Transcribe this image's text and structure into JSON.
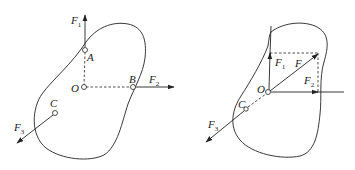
{
  "diagram": {
    "colors": {
      "stroke": "#222222",
      "background": "#ffffff"
    },
    "left": {
      "points": {
        "O": {
          "label": "O",
          "x": 83,
          "y": 87
        },
        "A": {
          "label": "A",
          "x": 85,
          "y": 50
        },
        "B": {
          "label": "B",
          "x": 133,
          "y": 87
        },
        "C": {
          "label": "C",
          "x": 55,
          "y": 113
        }
      },
      "forces": [
        {
          "label": "F",
          "sub": "1",
          "from": "A",
          "direction": "up"
        },
        {
          "label": "F",
          "sub": "2",
          "from": "B",
          "direction": "right"
        },
        {
          "label": "F",
          "sub": "3",
          "from": "C",
          "direction": "down-left"
        }
      ],
      "dashed_lines": [
        "O-A",
        "O-B"
      ]
    },
    "right": {
      "points": {
        "O": {
          "label": "O",
          "x": 268,
          "y": 92
        },
        "C": {
          "label": "C",
          "x": 246,
          "y": 109
        }
      },
      "forces": [
        {
          "label": "F",
          "sub": "1",
          "from": "O",
          "direction": "up"
        },
        {
          "label": "F",
          "sub": "2",
          "from": "O",
          "direction": "right"
        },
        {
          "label": "F",
          "sub": "",
          "from": "O",
          "direction": "up-right (resultant)"
        },
        {
          "label": "F",
          "sub": "3",
          "from": "C",
          "direction": "down-left"
        }
      ],
      "dashed_lines": [
        "parallelogram top",
        "parallelogram right",
        "C-O line of action"
      ]
    },
    "labels": {
      "F": "F",
      "s1": "1",
      "s2": "2",
      "s3": "3",
      "O": "O",
      "A": "A",
      "B": "B",
      "C": "C"
    }
  }
}
